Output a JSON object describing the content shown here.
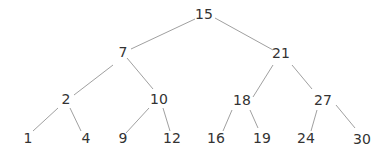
{
  "diagram": {
    "type": "binary-search-tree",
    "colors": {
      "text": "#333333",
      "edge": "#a0a0a0",
      "background": "#ffffff"
    },
    "nodes": [
      {
        "id": "n15",
        "label": "15",
        "x": 204,
        "y": 14
      },
      {
        "id": "n7",
        "label": "7",
        "x": 123,
        "y": 52
      },
      {
        "id": "n21",
        "label": "21",
        "x": 281,
        "y": 53
      },
      {
        "id": "n2",
        "label": "2",
        "x": 66,
        "y": 99
      },
      {
        "id": "n10",
        "label": "10",
        "x": 159,
        "y": 99
      },
      {
        "id": "n18",
        "label": "18",
        "x": 242,
        "y": 100
      },
      {
        "id": "n27",
        "label": "27",
        "x": 323,
        "y": 100
      },
      {
        "id": "n1",
        "label": "1",
        "x": 28,
        "y": 138
      },
      {
        "id": "n4",
        "label": "4",
        "x": 86,
        "y": 138
      },
      {
        "id": "n9",
        "label": "9",
        "x": 123,
        "y": 138
      },
      {
        "id": "n12",
        "label": "12",
        "x": 172,
        "y": 138
      },
      {
        "id": "n16",
        "label": "16",
        "x": 216,
        "y": 138
      },
      {
        "id": "n19",
        "label": "19",
        "x": 262,
        "y": 138
      },
      {
        "id": "n24",
        "label": "24",
        "x": 306,
        "y": 138
      },
      {
        "id": "n30",
        "label": "30",
        "x": 362,
        "y": 139
      }
    ],
    "edges": [
      {
        "from": "15",
        "to": "7",
        "x1": 195,
        "y1": 19,
        "x2": 131,
        "y2": 49
      },
      {
        "from": "15",
        "to": "21",
        "x1": 215,
        "y1": 18,
        "x2": 273,
        "y2": 50
      },
      {
        "from": "7",
        "to": "2",
        "x1": 113,
        "y1": 65,
        "x2": 74,
        "y2": 95
      },
      {
        "from": "7",
        "to": "10",
        "x1": 127,
        "y1": 58,
        "x2": 153,
        "y2": 89
      },
      {
        "from": "2",
        "to": "1",
        "x1": 58,
        "y1": 108,
        "x2": 33,
        "y2": 131
      },
      {
        "from": "2",
        "to": "4",
        "x1": 70,
        "y1": 108,
        "x2": 81,
        "y2": 131
      },
      {
        "from": "10",
        "to": "9",
        "x1": 149,
        "y1": 108,
        "x2": 126,
        "y2": 133
      },
      {
        "from": "10",
        "to": "12",
        "x1": 163,
        "y1": 108,
        "x2": 170,
        "y2": 131
      },
      {
        "from": "21",
        "to": "18",
        "x1": 273,
        "y1": 65,
        "x2": 253,
        "y2": 97
      },
      {
        "from": "21",
        "to": "27",
        "x1": 292,
        "y1": 65,
        "x2": 312,
        "y2": 89
      },
      {
        "from": "18",
        "to": "16",
        "x1": 232,
        "y1": 110,
        "x2": 223,
        "y2": 131
      },
      {
        "from": "18",
        "to": "19",
        "x1": 250,
        "y1": 110,
        "x2": 258,
        "y2": 128
      },
      {
        "from": "27",
        "to": "24",
        "x1": 317,
        "y1": 110,
        "x2": 311,
        "y2": 131
      },
      {
        "from": "27",
        "to": "30",
        "x1": 336,
        "y1": 105,
        "x2": 355,
        "y2": 128
      }
    ]
  }
}
